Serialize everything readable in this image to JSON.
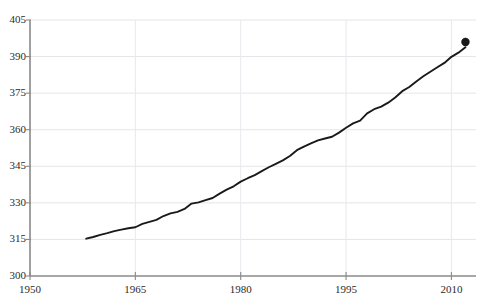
{
  "chart_data": {
    "type": "line",
    "title": "",
    "subtitle": "",
    "xlabel": "",
    "ylabel": "",
    "xlim": [
      1950,
      2013.5
    ],
    "ylim": [
      300,
      405
    ],
    "grid": true,
    "legend_position": "none",
    "x_ticks": [
      1950,
      1965,
      1980,
      1995,
      2010
    ],
    "x_tick_labels": [
      "1950",
      "1965",
      "1980",
      "1995",
      "2010"
    ],
    "y_ticks": [
      300,
      315,
      330,
      345,
      360,
      375,
      390,
      405
    ],
    "y_tick_labels": [
      "300",
      "315",
      "330",
      "345",
      "360",
      "375",
      "390",
      "405"
    ],
    "series": [
      {
        "name": "CO2 concentration",
        "color": "#1a1a1a",
        "line_width": 1.9,
        "end_marker": {
          "x": 2012,
          "y": 396.0,
          "shape": "circle",
          "radius": 4.2,
          "color": "#1a1a1a"
        },
        "x": [
          1958,
          1959,
          1960,
          1961,
          1962,
          1963,
          1964,
          1965,
          1966,
          1967,
          1968,
          1969,
          1970,
          1971,
          1972,
          1973,
          1974,
          1975,
          1976,
          1977,
          1978,
          1979,
          1980,
          1981,
          1982,
          1983,
          1984,
          1985,
          1986,
          1987,
          1988,
          1989,
          1990,
          1991,
          1992,
          1993,
          1994,
          1995,
          1996,
          1997,
          1998,
          1999,
          2000,
          2001,
          2002,
          2003,
          2004,
          2005,
          2006,
          2007,
          2008,
          2009,
          2010,
          2011,
          2012
        ],
        "values": [
          315.3,
          316.0,
          316.9,
          317.6,
          318.4,
          319.0,
          319.6,
          320.0,
          321.4,
          322.2,
          323.0,
          324.6,
          325.7,
          326.3,
          327.5,
          329.7,
          330.2,
          331.1,
          332.0,
          333.8,
          335.4,
          336.8,
          338.7,
          340.1,
          341.4,
          343.0,
          344.6,
          346.0,
          347.4,
          349.2,
          351.6,
          353.1,
          354.4,
          355.6,
          356.4,
          357.1,
          358.8,
          360.8,
          362.6,
          363.7,
          366.7,
          368.4,
          369.5,
          371.1,
          373.2,
          375.8,
          377.5,
          379.8,
          381.9,
          383.8,
          385.6,
          387.4,
          389.9,
          391.6,
          393.8
        ]
      }
    ]
  },
  "axis": {
    "y_axis_name": "y-axis",
    "x_axis_name": "x-axis"
  }
}
